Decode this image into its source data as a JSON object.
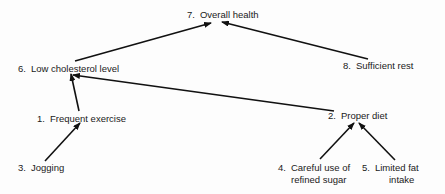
{
  "diagram": {
    "type": "goal-hierarchy",
    "nodes": [
      {
        "id": 7,
        "num": "7.",
        "label": "Overall health"
      },
      {
        "id": 6,
        "num": "6.",
        "label": "Low cholesterol level"
      },
      {
        "id": 8,
        "num": "8.",
        "label": "Sufficient rest"
      },
      {
        "id": 1,
        "num": "1.",
        "label": "Frequent exercise"
      },
      {
        "id": 2,
        "num": "2.",
        "label": "Proper diet"
      },
      {
        "id": 3,
        "num": "3.",
        "label": "Jogging"
      },
      {
        "id": 4,
        "num": "4.",
        "label_line1": "Careful use of",
        "label_line2": "refined sugar"
      },
      {
        "id": 5,
        "num": "5.",
        "label_line1": "Limited fat",
        "label_line2": "intake"
      }
    ],
    "edges": [
      {
        "from": 6,
        "to": 7
      },
      {
        "from": 8,
        "to": 7
      },
      {
        "from": 1,
        "to": 6
      },
      {
        "from": 2,
        "to": 6
      },
      {
        "from": 3,
        "to": 1
      },
      {
        "from": 4,
        "to": 2
      },
      {
        "from": 5,
        "to": 2
      }
    ],
    "line_color": "#111111"
  }
}
